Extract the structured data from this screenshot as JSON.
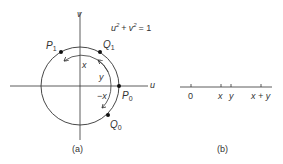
{
  "figure_a": {
    "caption": "(a)",
    "equation": {
      "u": "u",
      "plus": "+",
      "v": "v",
      "exp": "2",
      "eq": "= 1"
    },
    "axes": {
      "horizontal": "u",
      "vertical": "v"
    },
    "points": {
      "P0": {
        "letter": "P",
        "sub": "0"
      },
      "P1": {
        "letter": "P",
        "sub": "1"
      },
      "Q0": {
        "letter": "Q",
        "sub": "0"
      },
      "Q1": {
        "letter": "Q",
        "sub": "1"
      }
    },
    "arc_labels": {
      "x": "x",
      "y": "y",
      "neg_x": "−x"
    }
  },
  "figure_b": {
    "caption": "(b)",
    "ticks": [
      "0",
      "x",
      "y",
      "x + y"
    ]
  }
}
